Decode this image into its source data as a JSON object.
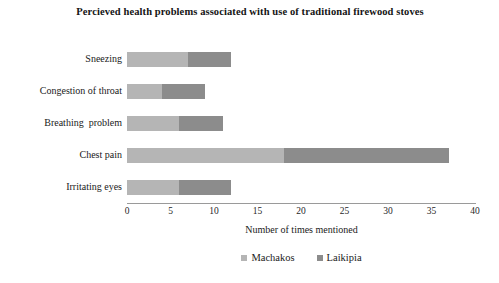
{
  "chart_data": {
    "type": "bar",
    "orientation": "horizontal",
    "stacked": true,
    "title": "Percieved health problems associated with use of traditional firewood stoves",
    "xlabel": "Number of times mentioned",
    "ylabel": "",
    "categories": [
      "Sneezing",
      "Congestion of throat",
      "Breathing  problem",
      "Chest pain",
      "Irritating eyes"
    ],
    "series": [
      {
        "name": "Machakos",
        "color": "#b5b5b5",
        "values": [
          7,
          4,
          6,
          18,
          6
        ]
      },
      {
        "name": "Laikipia",
        "color": "#8c8c8c",
        "values": [
          5,
          5,
          5,
          19,
          6
        ]
      }
    ],
    "totals": [
      12,
      9,
      11,
      37,
      12
    ],
    "xlim": [
      0,
      40
    ],
    "xticks": [
      0,
      5,
      10,
      15,
      20,
      25,
      30,
      35,
      40
    ],
    "xtick_labels": [
      "0",
      "5",
      "10",
      "15",
      "20",
      "25",
      "30",
      "35",
      "40"
    ],
    "grid": false,
    "legend_position": "bottom"
  }
}
